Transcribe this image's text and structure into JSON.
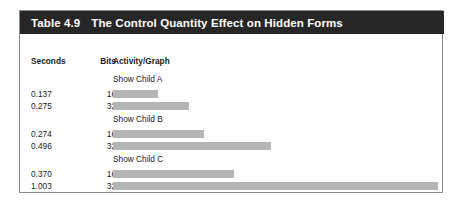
{
  "table": {
    "number_label": "Table 4.9",
    "title": "The Control Quantity Effect on Hidden Forms",
    "columns": {
      "seconds": "Seconds",
      "bits": "Bits",
      "activity": "Activity/Graph"
    },
    "groups": [
      {
        "label": "Show Child A",
        "rows": [
          {
            "seconds": "0.137",
            "bits": "16",
            "bar_px": 45
          },
          {
            "seconds": "0.275",
            "bits": "32",
            "bar_px": 76
          }
        ]
      },
      {
        "label": "Show Child B",
        "rows": [
          {
            "seconds": "0.274",
            "bits": "16",
            "bar_px": 91
          },
          {
            "seconds": "0.496",
            "bits": "32",
            "bar_px": 158
          }
        ]
      },
      {
        "label": "Show Child C",
        "rows": [
          {
            "seconds": "0.370",
            "bits": "16",
            "bar_px": 121
          },
          {
            "seconds": "1.003",
            "bits": "32",
            "bar_px": 325
          }
        ]
      }
    ]
  },
  "chart_data": {
    "type": "bar",
    "title": "The Control Quantity Effect on Hidden Forms",
    "xlabel": "Seconds",
    "ylabel": "",
    "orientation": "horizontal",
    "categories": [
      "Show Child A / 16",
      "Show Child A / 32",
      "Show Child B / 16",
      "Show Child B / 32",
      "Show Child C / 16",
      "Show Child C / 32"
    ],
    "values": [
      0.137,
      0.275,
      0.274,
      0.496,
      0.37,
      1.003
    ],
    "bits": [
      16,
      32,
      16,
      32,
      16,
      32
    ],
    "groups": [
      "Show Child A",
      "Show Child A",
      "Show Child B",
      "Show Child B",
      "Show Child C",
      "Show Child C"
    ],
    "xlim": [
      0,
      1.003
    ],
    "grid": false,
    "legend": false,
    "bar_color": "#b5b5b5"
  },
  "colors": {
    "header_bg": "#262626",
    "header_text": "#ffffff",
    "bar": "#b5b5b5",
    "card_border": "#8a8a8a",
    "body_text": "#1a1a1a"
  }
}
